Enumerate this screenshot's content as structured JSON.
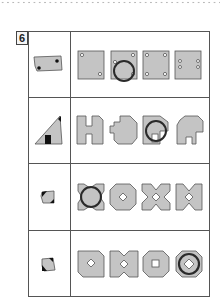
{
  "question": {
    "number": "6",
    "rows": [
      {
        "row_index": 1,
        "prompt_shape": "folded-paper-rectangle-with-two-punched-holes",
        "options": [
          {
            "index": 1,
            "shape": "square-with-two-diagonal-holes",
            "circled": false
          },
          {
            "index": 2,
            "shape": "square-with-four-corner-holes-variant",
            "circled": true
          },
          {
            "index": 3,
            "shape": "square-with-four-corner-holes",
            "circled": false
          },
          {
            "index": 4,
            "shape": "square-with-four-side-paired-holes",
            "circled": false
          }
        ]
      },
      {
        "row_index": 2,
        "prompt_shape": "folded-triangle-with-black-square-cut",
        "options": [
          {
            "index": 1,
            "shape": "h-shape-cutout",
            "circled": false
          },
          {
            "index": 2,
            "shape": "octagon-plus-shape",
            "circled": false
          },
          {
            "index": 3,
            "shape": "notched-square-with-white-square",
            "circled": true
          },
          {
            "index": 4,
            "shape": "arch-shape-cutout",
            "circled": false
          }
        ]
      },
      {
        "row_index": 3,
        "prompt_shape": "folded-small-square-cut-corner",
        "options": [
          {
            "index": 1,
            "shape": "notched-square-with-circle",
            "circled": true
          },
          {
            "index": 2,
            "shape": "octagon-with-center-diamond",
            "circled": false
          },
          {
            "index": 3,
            "shape": "x-shape-with-center-diamond",
            "circled": false
          },
          {
            "index": 4,
            "shape": "bowtie-with-center-diamond",
            "circled": false
          }
        ]
      },
      {
        "row_index": 4,
        "prompt_shape": "folded-small-square-two-corners-cut",
        "options": [
          {
            "index": 1,
            "shape": "square-two-corners-cut-with-diamond",
            "circled": false
          },
          {
            "index": 2,
            "shape": "side-notched-square-with-diamond",
            "circled": false
          },
          {
            "index": 3,
            "shape": "octagon-with-white-square",
            "circled": false
          },
          {
            "index": 4,
            "shape": "octagon-with-diamond",
            "circled": true
          }
        ]
      }
    ]
  },
  "colors": {
    "fill": "#c4c4c4",
    "stroke": "#555555",
    "circle": "#2a2a2a",
    "black": "#111111"
  }
}
